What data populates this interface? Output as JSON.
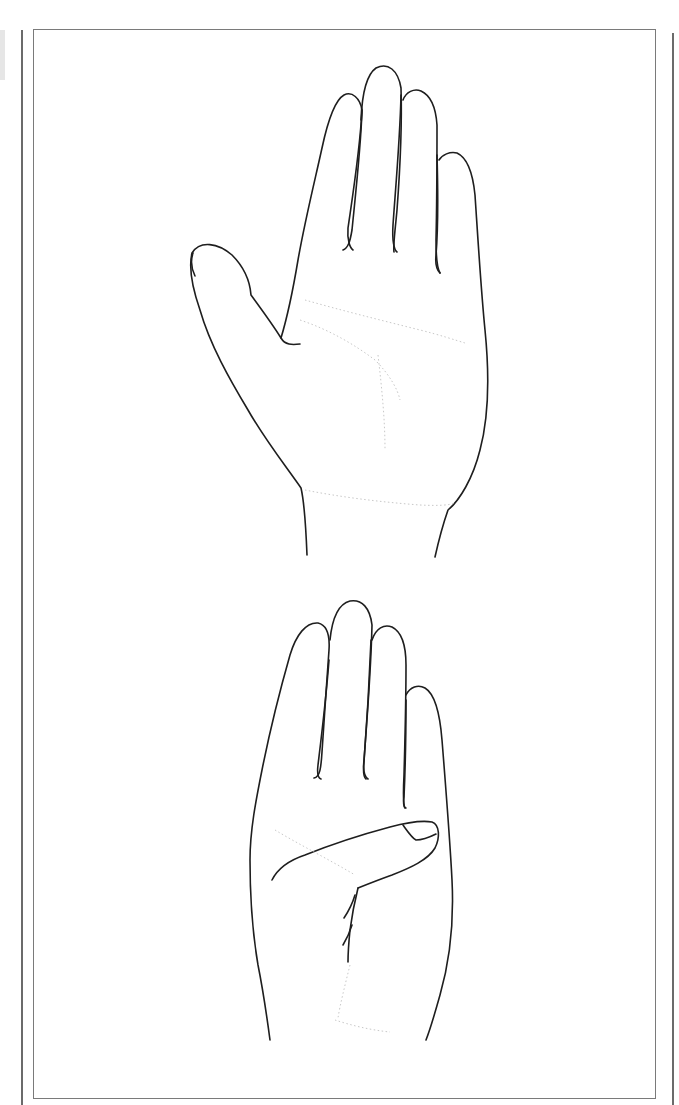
{
  "page": {
    "type": "line-art illustration page",
    "colors": {
      "background": "#ffffff",
      "ink": "#1e1e1e",
      "frame": "#7a7a7a",
      "crease": "#c8c8c8"
    }
  },
  "illustrations": [
    {
      "id": "hand-open",
      "description": "Open right palm facing viewer with fingers together and thumb extended outward"
    },
    {
      "id": "hand-thumb-folded",
      "description": "Palm facing viewer with four fingers extended and thumb folded across the palm"
    }
  ]
}
